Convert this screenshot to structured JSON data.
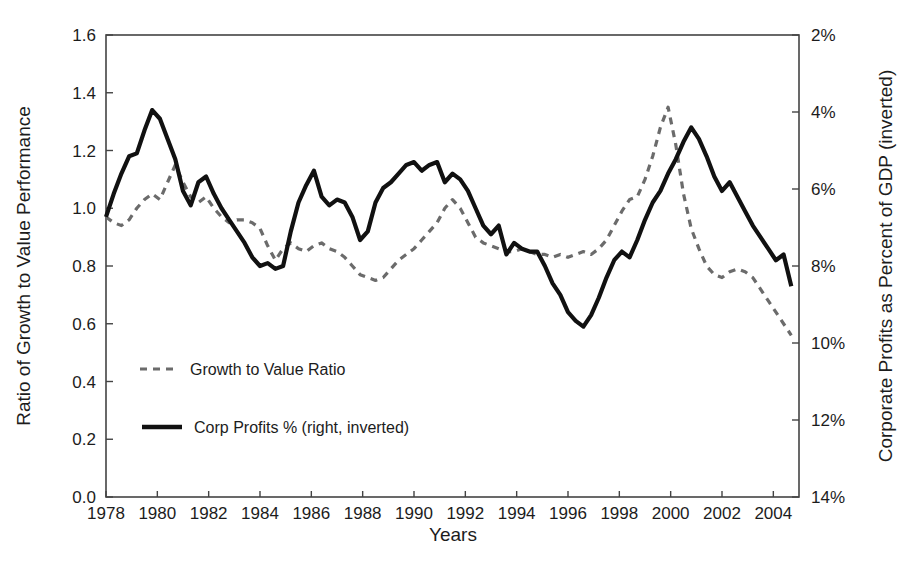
{
  "chart_data": {
    "type": "line",
    "title": "",
    "xlabel": "Years",
    "ylabel": "Ratio of Growth to Value Performance",
    "y2label": "Corporate Profits as Percent of GDP (inverted)",
    "xlim": [
      1978,
      2005
    ],
    "ylim": [
      0.0,
      1.6
    ],
    "y2lim": [
      14,
      2
    ],
    "y2_inverted": true,
    "grid": false,
    "legend_position": "inside-left-lower",
    "xticks": [
      "1978",
      "1980",
      "1982",
      "1984",
      "1986",
      "1988",
      "1990",
      "1992",
      "1994",
      "1996",
      "1998",
      "2000",
      "2002",
      "2004"
    ],
    "xtick_values": [
      1978,
      1980,
      1982,
      1984,
      1986,
      1988,
      1990,
      1992,
      1994,
      1996,
      1998,
      2000,
      2002,
      2004
    ],
    "yticks": [
      "0.0",
      "0.2",
      "0.4",
      "0.6",
      "0.8",
      "1.0",
      "1.2",
      "1.4",
      "1.6"
    ],
    "ytick_values": [
      0.0,
      0.2,
      0.4,
      0.6,
      0.8,
      1.0,
      1.2,
      1.4,
      1.6
    ],
    "y2ticks": [
      "2%",
      "4%",
      "6%",
      "8%",
      "10%",
      "12%",
      "14%"
    ],
    "y2tick_values": [
      2,
      4,
      6,
      8,
      10,
      12,
      14
    ],
    "series": [
      {
        "name": "Growth to Value Ratio",
        "axis": "left",
        "style": "dashed",
        "color": "#6b6b6b",
        "x": [
          1978.0,
          1978.3,
          1978.6,
          1978.9,
          1979.2,
          1979.5,
          1979.8,
          1980.1,
          1980.4,
          1980.7,
          1981.0,
          1981.3,
          1981.6,
          1981.9,
          1982.2,
          1982.5,
          1982.8,
          1983.1,
          1983.4,
          1983.7,
          1984.0,
          1984.3,
          1984.6,
          1984.9,
          1985.2,
          1985.5,
          1985.8,
          1986.1,
          1986.4,
          1986.7,
          1987.0,
          1987.3,
          1987.6,
          1987.9,
          1988.2,
          1988.5,
          1988.8,
          1989.1,
          1989.4,
          1989.7,
          1990.0,
          1990.3,
          1990.6,
          1990.9,
          1991.2,
          1991.5,
          1991.8,
          1992.1,
          1992.4,
          1992.7,
          1993.0,
          1993.3,
          1993.6,
          1993.9,
          1994.2,
          1994.5,
          1994.8,
          1995.1,
          1995.4,
          1995.7,
          1996.0,
          1996.3,
          1996.6,
          1996.9,
          1997.2,
          1997.5,
          1997.8,
          1998.1,
          1998.4,
          1998.7,
          1999.0,
          1999.3,
          1999.6,
          1999.9,
          2000.2,
          2000.5,
          2000.8,
          2001.1,
          2001.4,
          2001.7,
          2002.0,
          2002.3,
          2002.6,
          2002.9,
          2003.2,
          2003.5,
          2003.8,
          2004.1,
          2004.4,
          2004.7
        ],
        "values": [
          0.97,
          0.95,
          0.94,
          0.96,
          1.0,
          1.03,
          1.05,
          1.03,
          1.09,
          1.15,
          1.09,
          1.04,
          1.02,
          1.04,
          1.0,
          0.97,
          0.95,
          0.96,
          0.96,
          0.95,
          0.93,
          0.87,
          0.82,
          0.86,
          0.88,
          0.86,
          0.85,
          0.87,
          0.88,
          0.86,
          0.85,
          0.83,
          0.8,
          0.77,
          0.76,
          0.75,
          0.76,
          0.79,
          0.82,
          0.84,
          0.86,
          0.89,
          0.92,
          0.95,
          1.0,
          1.03,
          1.0,
          0.95,
          0.9,
          0.88,
          0.87,
          0.86,
          0.85,
          0.85,
          0.86,
          0.85,
          0.84,
          0.84,
          0.83,
          0.84,
          0.83,
          0.84,
          0.85,
          0.84,
          0.86,
          0.89,
          0.94,
          0.99,
          1.03,
          1.04,
          1.1,
          1.18,
          1.28,
          1.35,
          1.22,
          1.05,
          0.93,
          0.86,
          0.8,
          0.77,
          0.76,
          0.78,
          0.79,
          0.78,
          0.76,
          0.72,
          0.68,
          0.64,
          0.6,
          0.56
        ]
      },
      {
        "name": "Corp Profits % (right, inverted)",
        "axis": "right",
        "style": "solid",
        "color": "#111111",
        "x": [
          1978.0,
          1978.3,
          1978.6,
          1978.9,
          1979.2,
          1979.5,
          1979.8,
          1980.1,
          1980.4,
          1980.7,
          1981.0,
          1981.3,
          1981.6,
          1981.9,
          1982.2,
          1982.5,
          1982.8,
          1983.1,
          1983.4,
          1983.7,
          1984.0,
          1984.3,
          1984.6,
          1984.9,
          1985.2,
          1985.5,
          1985.8,
          1986.1,
          1986.4,
          1986.7,
          1987.0,
          1987.3,
          1987.6,
          1987.9,
          1988.2,
          1988.5,
          1988.8,
          1989.1,
          1989.4,
          1989.7,
          1990.0,
          1990.3,
          1990.6,
          1990.9,
          1991.2,
          1991.5,
          1991.8,
          1992.1,
          1992.4,
          1992.7,
          1993.0,
          1993.3,
          1993.6,
          1993.9,
          1994.2,
          1994.5,
          1994.8,
          1995.1,
          1995.4,
          1995.7,
          1996.0,
          1996.3,
          1996.6,
          1996.9,
          1997.2,
          1997.5,
          1997.8,
          1998.1,
          1998.4,
          1998.7,
          1999.0,
          1999.3,
          1999.6,
          1999.9,
          2000.2,
          2000.5,
          2000.8,
          2001.1,
          2001.4,
          2001.7,
          2002.0,
          2002.3,
          2002.6,
          2002.9,
          2003.2,
          2003.5,
          2003.8,
          2004.1,
          2004.4,
          2004.7
        ],
        "values_left_scale": [
          0.97,
          1.05,
          1.12,
          1.18,
          1.19,
          1.27,
          1.34,
          1.31,
          1.24,
          1.17,
          1.06,
          1.01,
          1.09,
          1.11,
          1.05,
          1.0,
          0.96,
          0.92,
          0.88,
          0.83,
          0.8,
          0.81,
          0.79,
          0.8,
          0.92,
          1.02,
          1.08,
          1.13,
          1.04,
          1.01,
          1.03,
          1.02,
          0.97,
          0.89,
          0.92,
          1.02,
          1.07,
          1.09,
          1.12,
          1.15,
          1.16,
          1.13,
          1.15,
          1.16,
          1.09,
          1.12,
          1.1,
          1.06,
          1.0,
          0.94,
          0.91,
          0.94,
          0.84,
          0.88,
          0.86,
          0.85,
          0.85,
          0.8,
          0.74,
          0.7,
          0.64,
          0.61,
          0.59,
          0.63,
          0.69,
          0.76,
          0.82,
          0.85,
          0.83,
          0.89,
          0.96,
          1.02,
          1.06,
          1.12,
          1.17,
          1.23,
          1.28,
          1.24,
          1.18,
          1.11,
          1.06,
          1.09,
          1.04,
          0.99,
          0.94,
          0.9,
          0.86,
          0.82,
          0.84,
          0.73
        ],
        "values_percent": [
          7.1,
          6.7,
          6.4,
          6.1,
          6.1,
          5.7,
          5.4,
          5.5,
          5.8,
          6.1,
          6.6,
          6.8,
          6.4,
          6.3,
          6.6,
          6.9,
          7.1,
          7.3,
          7.5,
          7.8,
          7.9,
          7.9,
          8.0,
          7.9,
          7.4,
          6.9,
          6.6,
          6.4,
          6.8,
          7.0,
          6.9,
          6.9,
          7.1,
          7.5,
          7.4,
          6.9,
          6.7,
          6.6,
          6.4,
          6.3,
          6.3,
          6.4,
          6.3,
          6.3,
          6.6,
          6.5,
          6.6,
          6.8,
          7.1,
          7.3,
          7.5,
          7.3,
          7.8,
          7.6,
          7.7,
          7.7,
          7.7,
          8.0,
          8.3,
          8.5,
          8.8,
          8.9,
          9.0,
          8.8,
          8.5,
          8.2,
          7.9,
          7.7,
          7.8,
          7.6,
          7.2,
          6.9,
          6.7,
          6.4,
          6.2,
          5.9,
          5.6,
          5.8,
          6.1,
          6.4,
          6.7,
          6.5,
          6.8,
          7.0,
          7.3,
          7.5,
          7.7,
          7.9,
          7.8,
          8.3
        ]
      }
    ]
  },
  "legend": {
    "items": [
      {
        "label": "Growth to Value Ratio",
        "style": "dashed"
      },
      {
        "label": "Corp Profits % (right, inverted)",
        "style": "solid"
      }
    ]
  }
}
